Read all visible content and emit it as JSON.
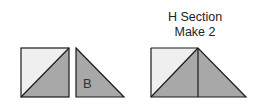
{
  "diagram": {
    "heading": {
      "line1": "H Section",
      "line2": "Make 2"
    },
    "pieces": [
      {
        "id": "half-square-triangle-unit",
        "label": "",
        "shape": "square split diagonally"
      },
      {
        "id": "triangle-b",
        "label": "B",
        "shape": "right triangle"
      },
      {
        "id": "h-section-assembled",
        "label": "",
        "shape": "square + triangle joined"
      }
    ],
    "colors": {
      "light_fill": "#efefef",
      "dark_fill": "#a8a8a8",
      "stroke": "#1a1a1a"
    }
  }
}
